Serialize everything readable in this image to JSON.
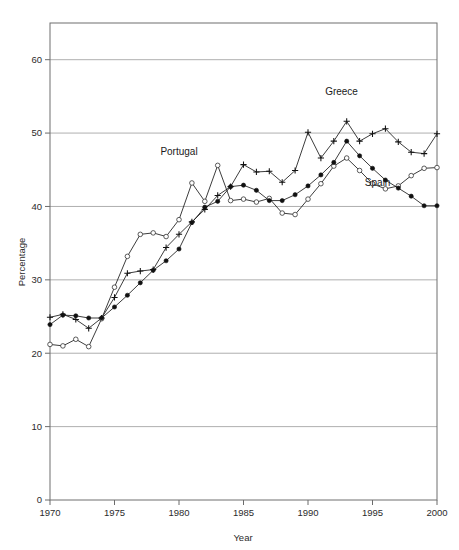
{
  "chart_data": {
    "type": "line",
    "title": "",
    "xlabel": "Year",
    "ylabel": "Percentage",
    "xlim": [
      1970,
      2000
    ],
    "ylim": [
      0,
      65
    ],
    "xticks": [
      1970,
      1975,
      1980,
      1985,
      1990,
      1995,
      2000
    ],
    "yticks": [
      0,
      10,
      20,
      30,
      40,
      50,
      60
    ],
    "ytick_labels": [
      "0",
      "10",
      "20",
      "30",
      "40",
      "50",
      "60"
    ],
    "xtick_labels": [
      "1970",
      "1975",
      "1980",
      "1985",
      "1990",
      "1995",
      "2000"
    ],
    "grid": "horizontal",
    "legend_position": "inline-annotations",
    "x": [
      1970,
      1971,
      1972,
      1973,
      1974,
      1975,
      1976,
      1977,
      1978,
      1979,
      1980,
      1981,
      1982,
      1983,
      1984,
      1985,
      1986,
      1987,
      1988,
      1989,
      1990,
      1991,
      1992,
      1993,
      1994,
      1995,
      1996,
      1997,
      1998,
      1999,
      2000
    ],
    "series": [
      {
        "name": "Greece",
        "marker": "plus",
        "values": [
          24.9,
          25.3,
          24.6,
          23.4,
          24.8,
          27.6,
          30.9,
          31.2,
          31.4,
          34.4,
          36.2,
          37.9,
          39.6,
          41.5,
          42.7,
          45.7,
          44.7,
          44.8,
          43.3,
          44.9,
          50.1,
          46.6,
          48.9,
          51.6,
          48.9,
          49.9,
          50.6,
          48.8,
          47.4,
          47.2,
          49.9
        ]
      },
      {
        "name": "Portugal",
        "marker": "open-circle",
        "values": [
          21.2,
          21.0,
          21.9,
          20.9,
          24.7,
          29.0,
          33.2,
          36.2,
          36.4,
          35.9,
          38.2,
          43.2,
          40.7,
          45.6,
          40.8,
          41.0,
          40.6,
          41.1,
          39.1,
          38.9,
          41.0,
          43.1,
          45.5,
          46.6,
          44.9,
          43.1,
          42.4,
          42.8,
          44.2,
          45.2,
          45.3
        ]
      },
      {
        "name": "Spain",
        "marker": "filled-circle",
        "values": [
          23.9,
          25.2,
          25.1,
          24.8,
          24.8,
          26.3,
          27.9,
          29.6,
          31.3,
          32.6,
          34.2,
          37.8,
          39.9,
          40.7,
          42.7,
          42.9,
          42.2,
          40.8,
          40.8,
          41.6,
          42.8,
          44.3,
          46.0,
          48.9,
          46.9,
          45.2,
          43.6,
          42.5,
          41.4,
          40.1,
          40.1
        ]
      }
    ],
    "annotations": [
      {
        "text": "Greece",
        "x": 1992.6,
        "y": 55.2
      },
      {
        "text": "Portugal",
        "x": 1980.0,
        "y": 47.0
      },
      {
        "text": "Spain",
        "x": 1995.4,
        "y": 42.8
      }
    ]
  }
}
